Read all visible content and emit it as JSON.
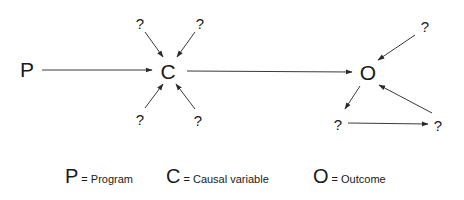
{
  "diagram": {
    "nodes": {
      "P": {
        "label": "P",
        "x": 27,
        "y": 77
      },
      "C": {
        "label": "C",
        "x": 168,
        "y": 79
      },
      "O": {
        "label": "O",
        "x": 368,
        "y": 80
      },
      "q_c_top_left": {
        "label": "?",
        "x": 140,
        "y": 29
      },
      "q_c_top_right": {
        "label": "?",
        "x": 200,
        "y": 29
      },
      "q_c_bottom_left": {
        "label": "?",
        "x": 140,
        "y": 125
      },
      "q_c_bottom_right": {
        "label": "?",
        "x": 198,
        "y": 126
      },
      "q_o_top_right": {
        "label": "?",
        "x": 425,
        "y": 32
      },
      "q_o_bottom_left": {
        "label": "?",
        "x": 338,
        "y": 130
      },
      "q_o_bottom_right": {
        "label": "?",
        "x": 438,
        "y": 131
      }
    },
    "edges": [
      {
        "from": "P",
        "to": "C"
      },
      {
        "from": "q_c_top_left",
        "to": "C"
      },
      {
        "from": "q_c_top_right",
        "to": "C"
      },
      {
        "from": "q_c_bottom_left",
        "to": "C"
      },
      {
        "from": "q_c_bottom_right",
        "to": "C"
      },
      {
        "from": "C",
        "to": "O"
      },
      {
        "from": "q_o_top_right",
        "to": "O"
      },
      {
        "from": "O",
        "to": "q_o_bottom_left"
      },
      {
        "from": "q_o_bottom_left",
        "to": "q_o_bottom_right"
      },
      {
        "from": "q_o_bottom_right",
        "to": "O"
      }
    ]
  },
  "legend": {
    "items": [
      {
        "symbol": "P",
        "text": "= Program"
      },
      {
        "symbol": "C",
        "text": "= Causal variable"
      },
      {
        "symbol": "O",
        "text": "= Outcome"
      }
    ]
  },
  "colors": {
    "text": "#1a1a1a",
    "edge": "#3a3a3a",
    "background": "#ffffff"
  }
}
